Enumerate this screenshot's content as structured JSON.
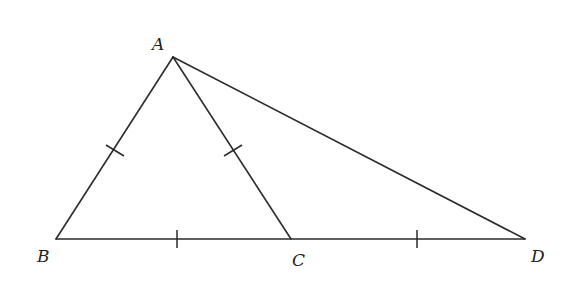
{
  "diagram": {
    "type": "geometry-triangle",
    "points": {
      "A": {
        "label": "A",
        "x": 173,
        "y": 57
      },
      "B": {
        "label": "B",
        "x": 56,
        "y": 239
      },
      "C": {
        "label": "C",
        "x": 291,
        "y": 239
      },
      "D": {
        "label": "D",
        "x": 525,
        "y": 239
      }
    },
    "segments": [
      "AB",
      "AC",
      "AD",
      "BC",
      "CD"
    ],
    "equal_marks": [
      "AB",
      "AC",
      "BC",
      "CD"
    ],
    "colors": {
      "line": "#2b2b2b",
      "label": "#222222",
      "background": "#ffffff"
    }
  }
}
